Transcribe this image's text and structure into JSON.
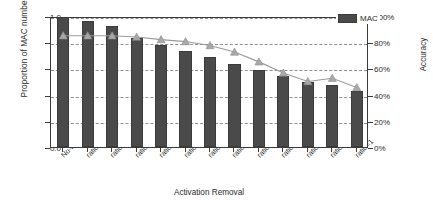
{
  "chart_data": {
    "type": "bar",
    "title": "",
    "xlabel": "Activation Removal",
    "ylabel": "Proportion of MAC number",
    "ylabel_secondary": "Accuracy",
    "grid": true,
    "legend_position": "top-right",
    "categories": [
      "No-Prune",
      "ratio=0.05",
      "ratio=0.2",
      "ratio=0.5",
      "ratio=0.6",
      "ratio=0.65",
      "ratio=0.7",
      "ratio=0.75",
      "ratio=0.8",
      "ratio=0.85",
      "ratio=0.9",
      "ratio=0.95",
      "ratio=1"
    ],
    "series": [
      {
        "name": "MAC",
        "type": "bar",
        "axis": "left",
        "color": "#4a4a4a",
        "values": [
          1.0,
          0.96,
          0.925,
          0.83,
          0.78,
          0.735,
          0.69,
          0.635,
          0.585,
          0.545,
          0.5,
          0.47,
          0.425
        ]
      },
      {
        "name": "Accuracy",
        "type": "line",
        "axis": "right",
        "color": "#9a9a9a",
        "marker": "triangle",
        "values": [
          86.5,
          86.5,
          86.5,
          85.5,
          83.5,
          82.0,
          79.0,
          74.0,
          66.5,
          58.0,
          51.5,
          54.0,
          47.0
        ]
      }
    ],
    "ylim": [
      0.0,
      1.0
    ],
    "ylim_secondary": [
      0,
      100
    ],
    "yticks": [
      "0.0",
      "0.2",
      "0.4",
      "0.6",
      "0.8",
      "1.0"
    ],
    "ytick_values": [
      0.0,
      0.2,
      0.4,
      0.6,
      0.8,
      1.0
    ],
    "yticks_secondary": [
      "0%",
      "20%",
      "40%",
      "60%",
      "80%",
      "100%"
    ],
    "ytick_values_secondary": [
      0,
      20,
      40,
      60,
      80,
      100
    ]
  },
  "legend": {
    "entries": [
      {
        "label": "MAC",
        "color": "#4a4a4a"
      }
    ]
  }
}
